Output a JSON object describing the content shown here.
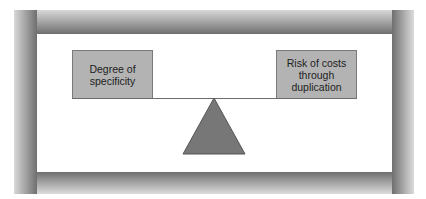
{
  "diagram": {
    "type": "balance-scale",
    "left_weight": {
      "label": "Degree of\nspecificity"
    },
    "right_weight": {
      "label": "Risk of costs\nthrough\nduplication"
    },
    "fulcrum": {
      "shape": "triangle",
      "color": "#777777"
    },
    "colors": {
      "box_fill": "#b3b3b3",
      "box_border": "#7a7a7a",
      "beam": "#6c6c6c",
      "frame": "#8a8a8a",
      "panel": "#ffffff"
    }
  }
}
